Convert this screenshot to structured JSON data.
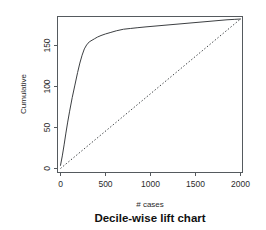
{
  "chart_data": {
    "type": "line",
    "title": "Decile-wise lift chart",
    "xlabel": "# cases",
    "ylabel": "Cumulative",
    "xlim": [
      0,
      2000
    ],
    "ylim": [
      0,
      190
    ],
    "xticks": [
      0,
      500,
      1000,
      1500,
      2000
    ],
    "xtick_labels": [
      "0",
      "500",
      "1000",
      "1500",
      "2000"
    ],
    "yticks": [
      0,
      50,
      100,
      150
    ],
    "ytick_labels": [
      "0",
      "50",
      "100",
      "150"
    ],
    "grid": false,
    "legend": "none",
    "frame": "box",
    "series": [
      {
        "name": "Cumulative lift curve",
        "style": "solid",
        "color": "#3c3f42",
        "x": [
          0,
          20,
          40,
          60,
          80,
          100,
          130,
          160,
          190,
          215,
          240,
          265,
          290,
          320,
          350,
          380,
          410,
          450,
          500,
          560,
          620,
          700,
          780,
          860,
          950,
          1050,
          1150,
          1250,
          1350,
          1450,
          1550,
          1650,
          1750,
          1850,
          1930,
          2000
        ],
        "y": [
          4,
          16,
          30,
          45,
          59,
          72,
          90,
          106,
          122,
          134,
          144,
          152,
          157,
          161,
          163,
          165,
          167,
          169,
          171,
          173,
          175,
          177,
          178,
          179,
          180,
          181,
          182,
          183,
          184,
          185,
          186,
          187,
          188,
          189,
          189.5,
          190
        ]
      },
      {
        "name": "Baseline (random) reference",
        "style": "dotted",
        "color": "#3c3f42",
        "x": [
          0,
          2000
        ],
        "y": [
          0,
          190
        ]
      }
    ]
  }
}
